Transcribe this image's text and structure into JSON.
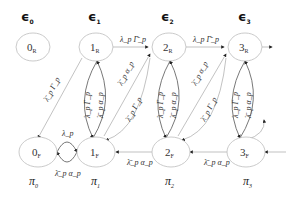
{
  "levels": [
    {
      "label": "ϵ",
      "sub": "0"
    },
    {
      "label": "ϵ",
      "sub": "1"
    },
    {
      "label": "ϵ",
      "sub": "2"
    },
    {
      "label": "ϵ",
      "sub": "3"
    }
  ],
  "nodes": {
    "top": [
      {
        "main": "0",
        "sub": "R"
      },
      {
        "main": "1",
        "sub": "R"
      },
      {
        "main": "2",
        "sub": "R"
      },
      {
        "main": "3",
        "sub": "R"
      }
    ],
    "bottom": [
      {
        "main": "0",
        "sub": "F"
      },
      {
        "main": "1",
        "sub": "F"
      },
      {
        "main": "2",
        "sub": "F"
      },
      {
        "main": "3",
        "sub": "F"
      }
    ]
  },
  "probabilities": [
    {
      "label": "π",
      "sub": "0"
    },
    {
      "label": "π",
      "sub": "1"
    },
    {
      "label": "π",
      "sub": "2"
    },
    {
      "label": "π",
      "sub": "3"
    }
  ],
  "edges": {
    "top_horizontal": "λ_p Γ̄_p",
    "diag_up": "λ̄_p α_p",
    "diag_down": "λ̄_p Γ_p",
    "loop_up": "λ_p Γ_p",
    "loop_down": "λ̄_p α_p",
    "bottom_horizontal": "λ̄_p α_p",
    "self_loop_top": "λ_p",
    "self_loop_bottom": "λ̄_p α_p",
    "left_diag": "λ̄_p Γ_p"
  }
}
